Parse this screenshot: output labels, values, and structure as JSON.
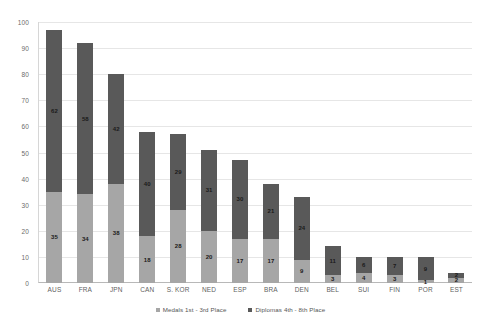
{
  "chart_data": {
    "type": "bar",
    "subtype": "stacked-bar",
    "title": "",
    "subtitle": "",
    "xlabel": "",
    "ylabel": "",
    "ylim": [
      0,
      100
    ],
    "ytick_step": 10,
    "yticks": [
      0,
      10,
      20,
      30,
      40,
      50,
      60,
      70,
      80,
      90,
      100
    ],
    "ytick_labels": [
      "0",
      "10",
      "20",
      "30",
      "40",
      "50",
      "60",
      "70",
      "80",
      "90",
      "100"
    ],
    "grid": "horizontal",
    "legend_position": "bottom",
    "categories": [
      "AUS",
      "FRA",
      "JPN",
      "CAN",
      "S. KOR",
      "NED",
      "ESP",
      "BRA",
      "DEN",
      "BEL",
      "SUI",
      "FIN",
      "POR",
      "EST"
    ],
    "series": [
      {
        "name": "Medals 1st - 3rd Place",
        "color": "#a6a6a6",
        "stack_position": "bottom",
        "values": [
          35,
          34,
          38,
          18,
          28,
          20,
          17,
          17,
          9,
          3,
          4,
          3,
          1,
          2
        ]
      },
      {
        "name": "Diplomas 4th - 8th Place",
        "color": "#595959",
        "stack_position": "top",
        "values": [
          62,
          58,
          42,
          40,
          29,
          31,
          30,
          21,
          24,
          11,
          6,
          7,
          9,
          2
        ]
      }
    ],
    "totals": [
      97,
      92,
      80,
      58,
      57,
      51,
      47,
      38,
      33,
      14,
      10,
      10,
      10,
      4
    ]
  },
  "legend": {
    "items": [
      {
        "label": "Medals 1st - 3rd Place",
        "color": "#a6a6a6"
      },
      {
        "label": "Diplomas 4th - 8th Place",
        "color": "#595959"
      }
    ]
  },
  "colors": {
    "background": "#ffffff",
    "grid": "#e6e6e6",
    "axis": "#b8b8b8",
    "series_medals": "#a6a6a6",
    "series_diplomas": "#595959",
    "tick_text": "#6b6b6b",
    "label_text": "#1a1a1a"
  }
}
